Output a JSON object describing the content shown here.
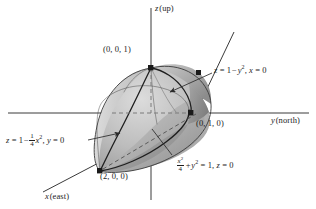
{
  "figure": {
    "type": "3d-coordinate-diagram",
    "background_color": "#ffffff",
    "ink_color": "#1d1d1d"
  },
  "axes": [
    {
      "key": "z",
      "label_var": "z",
      "label_dir": "(up)",
      "full": "z (up)"
    },
    {
      "key": "y",
      "label_var": "y",
      "label_dir": "(north)",
      "full": "y (north)"
    },
    {
      "key": "x",
      "label_var": "x",
      "label_dir": "(east)",
      "full": "x (east)"
    }
  ],
  "points": [
    {
      "name": "apex-z",
      "label": "(0, 0, 1)",
      "coords": [
        0,
        0,
        1
      ]
    },
    {
      "name": "y-intercept",
      "label": "(0, 1, 0)",
      "coords": [
        0,
        1,
        0
      ]
    },
    {
      "name": "x-intercept",
      "label": "(2, 0, 0)",
      "coords": [
        2,
        0,
        0
      ]
    }
  ],
  "equations": [
    {
      "name": "yz-parabola",
      "parts": {
        "lhs": "z",
        "eq": "=",
        "rhs_a": "1",
        "minus": "−",
        "rhs_var": "y",
        "rhs_pow": "2",
        "comma": ",",
        "cond_var": "x",
        "cond_eq": "= 0"
      },
      "plain": "z = 1 − y², x = 0"
    },
    {
      "name": "xz-parabola",
      "parts": {
        "lhs": "z",
        "eq": "=",
        "rhs_a": "1",
        "minus": "−",
        "frac_num": "1",
        "frac_den": "4",
        "rhs_var": "x",
        "rhs_pow": "2",
        "comma": ",",
        "cond_var": "y",
        "cond_eq": "= 0"
      },
      "plain": "z = 1 − (1/4)x², y = 0"
    },
    {
      "name": "base-ellipse",
      "parts": {
        "frac_num_var": "x",
        "frac_num_pow": "2",
        "frac_den": "4",
        "plus": "+",
        "term_var": "y",
        "term_pow": "2",
        "eq": "= 1",
        "comma": ",",
        "cond_var": "z",
        "cond_eq": "= 0"
      },
      "plain": "x²/4 + y² = 1, z = 0"
    }
  ],
  "colors": {
    "solid_light": "#d3d3d3",
    "solid_mid": "#b4b4b4",
    "solid_dark": "#8f8f8f",
    "solid_darkest": "#6f6f6f",
    "outline": "#2a2a2a",
    "axis": "#3a3a3a",
    "dash": "#555555"
  }
}
